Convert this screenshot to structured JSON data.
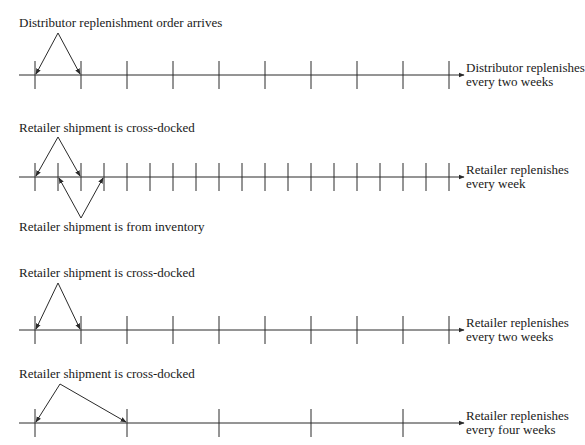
{
  "timelines": [
    {
      "id": "distributor",
      "top_label": "Distributor replenishment order arrives",
      "side_label": [
        "Distributor replenishes",
        "every two weeks"
      ],
      "axis_y": 75,
      "tick_interval_px": 46,
      "ticks_x": [
        35,
        81,
        127,
        173,
        219,
        265,
        311,
        357,
        403,
        449
      ],
      "top_arrows": {
        "apex": [
          58,
          33
        ],
        "targets": [
          35,
          81
        ]
      }
    },
    {
      "id": "retailer-weekly",
      "top_label": "Retailer shipment is cross-docked",
      "bottom_label": "Retailer shipment is from inventory",
      "side_label": [
        "Retailer replenishes",
        "every week"
      ],
      "axis_y": 177,
      "tick_interval_px": 23,
      "ticks_x": [
        35,
        58,
        81,
        104,
        127,
        150,
        173,
        196,
        219,
        242,
        265,
        288,
        311,
        334,
        357,
        380,
        403,
        426,
        449
      ],
      "top_arrows": {
        "apex": [
          58,
          137
        ],
        "targets": [
          35,
          81
        ]
      },
      "bottom_arrows": {
        "apex": [
          81,
          218
        ],
        "targets": [
          58,
          104
        ]
      }
    },
    {
      "id": "retailer-biweekly",
      "top_label": "Retailer shipment is cross-docked",
      "side_label": [
        "Retailer replenishes",
        "every two weeks"
      ],
      "axis_y": 330,
      "tick_interval_px": 46,
      "ticks_x": [
        35,
        81,
        127,
        173,
        219,
        265,
        311,
        357,
        403,
        449
      ],
      "top_arrows": {
        "apex": [
          58,
          283
        ],
        "targets": [
          35,
          81
        ]
      }
    },
    {
      "id": "retailer-fourweekly",
      "top_label": "Retailer shipment is cross-docked",
      "side_label": [
        "Retailer replenishes",
        "every four weeks"
      ],
      "axis_y": 423,
      "tick_interval_px": 92,
      "ticks_x": [
        35,
        127,
        219,
        311,
        403
      ],
      "top_arrows": {
        "apex": [
          60,
          384
        ],
        "targets": [
          35,
          127
        ]
      }
    }
  ],
  "style": {
    "line_color": "#2a2a2a",
    "text_color": "#1a1a1a",
    "background": "#ffffff"
  }
}
